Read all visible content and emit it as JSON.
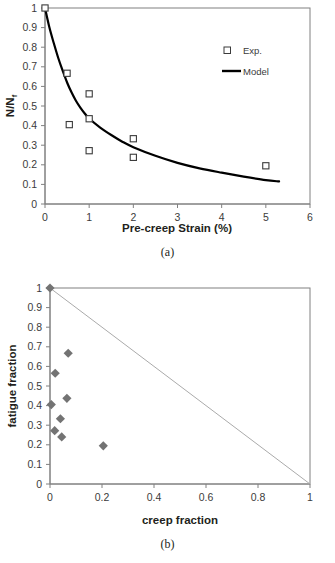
{
  "figure": {
    "panel_a_caption": "(a)",
    "panel_b_caption": "(b)"
  },
  "chart_data": [
    {
      "id": "panel-a",
      "type": "scatter",
      "title": "",
      "xlabel": "Pre-creep Strain (%)",
      "ylabel": "N/Nf",
      "ylabel_main": "N/N",
      "ylabel_sub": "f",
      "xlim": [
        0,
        6
      ],
      "ylim": [
        0,
        1
      ],
      "xticks": [
        "0",
        "1",
        "2",
        "3",
        "4",
        "5",
        "6"
      ],
      "xtick_values": [
        0,
        1,
        2,
        3,
        4,
        5,
        6
      ],
      "yticks": [
        "0",
        "0.1",
        "0.2",
        "0.3",
        "0.4",
        "0.5",
        "0.6",
        "0.7",
        "0.8",
        "0.9",
        "1"
      ],
      "ytick_values": [
        0,
        0.1,
        0.2,
        0.3,
        0.4,
        0.5,
        0.6,
        0.7,
        0.8,
        0.9,
        1
      ],
      "grid": false,
      "legend_position": "top-right",
      "series": [
        {
          "name": "Exp.",
          "marker": "open-square",
          "color": "#3b3b3b",
          "points": [
            {
              "x": 0.0,
              "y": 1.0
            },
            {
              "x": 0.5,
              "y": 0.667
            },
            {
              "x": 0.55,
              "y": 0.405
            },
            {
              "x": 1.0,
              "y": 0.562
            },
            {
              "x": 1.0,
              "y": 0.435
            },
            {
              "x": 1.0,
              "y": 0.272
            },
            {
              "x": 2.0,
              "y": 0.333
            },
            {
              "x": 2.0,
              "y": 0.238
            },
            {
              "x": 5.0,
              "y": 0.195
            }
          ]
        },
        {
          "name": "Model",
          "marker": "line",
          "color": "#000000",
          "points": [
            {
              "x": 0.0,
              "y": 1.0
            },
            {
              "x": 0.1,
              "y": 0.9
            },
            {
              "x": 0.2,
              "y": 0.82
            },
            {
              "x": 0.3,
              "y": 0.745
            },
            {
              "x": 0.4,
              "y": 0.68
            },
            {
              "x": 0.5,
              "y": 0.62
            },
            {
              "x": 0.6,
              "y": 0.57
            },
            {
              "x": 0.7,
              "y": 0.527
            },
            {
              "x": 0.8,
              "y": 0.492
            },
            {
              "x": 0.9,
              "y": 0.462
            },
            {
              "x": 1.0,
              "y": 0.436
            },
            {
              "x": 1.25,
              "y": 0.39
            },
            {
              "x": 1.5,
              "y": 0.352
            },
            {
              "x": 1.75,
              "y": 0.318
            },
            {
              "x": 2.0,
              "y": 0.29
            },
            {
              "x": 2.5,
              "y": 0.246
            },
            {
              "x": 3.0,
              "y": 0.21
            },
            {
              "x": 3.5,
              "y": 0.182
            },
            {
              "x": 4.0,
              "y": 0.16
            },
            {
              "x": 4.5,
              "y": 0.14
            },
            {
              "x": 5.0,
              "y": 0.122
            },
            {
              "x": 5.3,
              "y": 0.115
            }
          ]
        }
      ]
    },
    {
      "id": "panel-b",
      "type": "scatter",
      "title": "",
      "xlabel": "creep fraction",
      "ylabel": "fatigue fraction",
      "xlim": [
        0,
        1
      ],
      "ylim": [
        0,
        1
      ],
      "xticks": [
        "0",
        "0.2",
        "0.4",
        "0.6",
        "0.8",
        "1"
      ],
      "xtick_values": [
        0,
        0.2,
        0.4,
        0.6,
        0.8,
        1
      ],
      "yticks": [
        "0",
        "0.1",
        "0.2",
        "0.3",
        "0.4",
        "0.5",
        "0.6",
        "0.7",
        "0.8",
        "0.9",
        "1"
      ],
      "ytick_values": [
        0,
        0.1,
        0.2,
        0.3,
        0.4,
        0.5,
        0.6,
        0.7,
        0.8,
        0.9,
        1
      ],
      "grid": false,
      "legend_position": "none",
      "series": [
        {
          "name": "data",
          "marker": "filled-diamond",
          "color": "#737373",
          "points": [
            {
              "x": 0.0,
              "y": 1.0
            },
            {
              "x": 0.07,
              "y": 0.667
            },
            {
              "x": 0.02,
              "y": 0.565
            },
            {
              "x": 0.065,
              "y": 0.437
            },
            {
              "x": 0.005,
              "y": 0.405
            },
            {
              "x": 0.04,
              "y": 0.333
            },
            {
              "x": 0.018,
              "y": 0.272
            },
            {
              "x": 0.045,
              "y": 0.24
            },
            {
              "x": 0.205,
              "y": 0.195
            }
          ]
        },
        {
          "name": "reference-line",
          "marker": "line",
          "color": "#aaaaaa",
          "points": [
            {
              "x": 0.0,
              "y": 1.0
            },
            {
              "x": 1.0,
              "y": 0.0
            }
          ]
        }
      ]
    }
  ]
}
